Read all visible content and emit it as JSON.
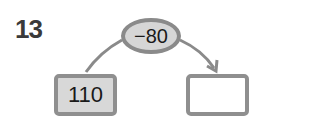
{
  "problem": {
    "number": "13",
    "operation": "−80",
    "start_value": "110",
    "answer_value": ""
  },
  "colors": {
    "oval_fill": "#d6d6d6",
    "border": "#8a8a8a",
    "start_box_fill": "#d8d8d8",
    "answer_box_fill": "#ffffff"
  }
}
